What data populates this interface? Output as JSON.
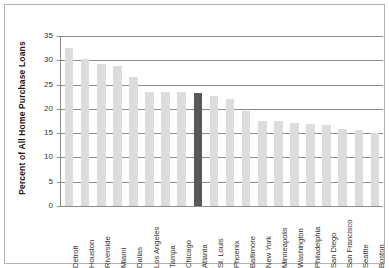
{
  "chart_data": {
    "type": "bar",
    "title": "",
    "xlabel": "",
    "ylabel": "Percent of All Home Purchase Loans",
    "ylim": [
      0,
      35
    ],
    "ytick_labels": [
      "0",
      "5",
      "10",
      "15",
      "20",
      "25",
      "30",
      "35"
    ],
    "ytick_values": [
      0,
      5,
      10,
      15,
      20,
      25,
      30,
      35
    ],
    "grid": "horizontal",
    "legend": "none",
    "highlight_category": "Atlanta",
    "colors": {
      "bar": "#dcdcdc",
      "bar_highlight": "#595959",
      "gridline": "#8c8c8c",
      "axis": "#8c8c8c",
      "text": "#333333",
      "axis_title": "#1a1a1a",
      "frame": "#b3b3b3",
      "background": "#ffffff"
    },
    "categories": [
      "Detroit",
      "Houston",
      "Riverside",
      "Miami",
      "Dallas",
      "Los Angeles",
      "Tampa",
      "Chicago",
      "Atlanta",
      "St. Louis",
      "Phoenix",
      "Baltimore",
      "New York",
      "Minneapolis",
      "Washington",
      "Philadelphia",
      "San Diego",
      "San Francisco",
      "Seattle",
      "Boston"
    ],
    "values": [
      32.5,
      30.2,
      29.2,
      28.9,
      26.5,
      23.5,
      23.5,
      23.5,
      23.2,
      22.7,
      22.0,
      19.5,
      17.6,
      17.5,
      17.0,
      16.8,
      16.7,
      15.8,
      15.7,
      15.0
    ]
  }
}
